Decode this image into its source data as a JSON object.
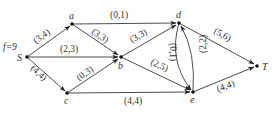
{
  "diagram": {
    "type": "flow-network",
    "flow_value_label": "f=9",
    "nodes": [
      {
        "id": "S",
        "label": "S",
        "x": 27,
        "y": 57
      },
      {
        "id": "a",
        "label": "a",
        "x": 72,
        "y": 24
      },
      {
        "id": "b",
        "label": "b",
        "x": 121,
        "y": 57
      },
      {
        "id": "c",
        "label": "c",
        "x": 67,
        "y": 93
      },
      {
        "id": "d",
        "label": "d",
        "x": 179,
        "y": 23
      },
      {
        "id": "e",
        "label": "e",
        "x": 193,
        "y": 92
      },
      {
        "id": "T",
        "label": "T",
        "x": 257,
        "y": 66
      }
    ],
    "edges": [
      {
        "from": "S",
        "to": "a",
        "label": "(3,4)",
        "flow": 3,
        "capacity": 4
      },
      {
        "from": "S",
        "to": "b",
        "label": "(2,3)",
        "flow": 2,
        "capacity": 3
      },
      {
        "from": "S",
        "to": "c",
        "label": "(4,4)",
        "flow": 4,
        "capacity": 4
      },
      {
        "from": "a",
        "to": "d",
        "label": "(0,1)",
        "flow": 0,
        "capacity": 1
      },
      {
        "from": "a",
        "to": "b",
        "label": "(3,3)",
        "flow": 3,
        "capacity": 3
      },
      {
        "from": "c",
        "to": "b",
        "label": "(0,3)",
        "flow": 0,
        "capacity": 3
      },
      {
        "from": "b",
        "to": "d",
        "label": "(3,3)",
        "flow": 3,
        "capacity": 3
      },
      {
        "from": "b",
        "to": "e",
        "label": "(2,5)",
        "flow": 2,
        "capacity": 5
      },
      {
        "from": "c",
        "to": "e",
        "label": "(4,4)",
        "flow": 4,
        "capacity": 4
      },
      {
        "from": "d",
        "to": "e",
        "label": "(0,1)",
        "flow": 0,
        "capacity": 1
      },
      {
        "from": "e",
        "to": "d",
        "label": "(2,2)",
        "flow": 2,
        "capacity": 2
      },
      {
        "from": "d",
        "to": "T",
        "label": "(5,6)",
        "flow": 5,
        "capacity": 6
      },
      {
        "from": "e",
        "to": "T",
        "label": "(4,4)",
        "flow": 4,
        "capacity": 4
      }
    ]
  }
}
